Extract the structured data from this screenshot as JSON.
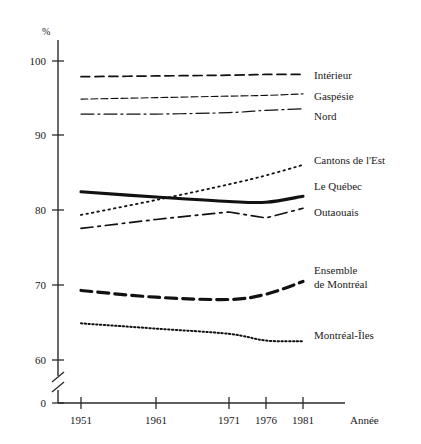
{
  "chart_data": {
    "type": "line",
    "title": "",
    "xlabel": "Année",
    "ylabel": "%",
    "x": [
      1951,
      1961,
      1971,
      1976,
      1981
    ],
    "xtick_labels": [
      "1951",
      "1961",
      "1971",
      "1976",
      "1981"
    ],
    "ytick_labels": [
      "0",
      "60",
      "70",
      "80",
      "90",
      "100"
    ],
    "ylim": [
      60,
      100
    ],
    "y_axis_broken": true,
    "y_axis_break_label": "0",
    "grid": false,
    "legend_position": "right",
    "series": [
      {
        "name": "Intérieur",
        "style": "dashed",
        "values": [
          97.9,
          98.0,
          98.1,
          98.2,
          98.2
        ]
      },
      {
        "name": "Gaspésie",
        "style": "fine-dashed",
        "values": [
          94.9,
          95.1,
          95.3,
          95.4,
          95.6
        ]
      },
      {
        "name": "Nord",
        "style": "dash-dot",
        "values": [
          92.9,
          92.9,
          93.1,
          93.4,
          93.6
        ]
      },
      {
        "name": "Cantons de l'Est",
        "style": "dotted",
        "values": [
          79.4,
          81.4,
          83.5,
          84.7,
          86.1
        ]
      },
      {
        "name": "Le Québec",
        "style": "thick-solid",
        "values": [
          82.5,
          81.8,
          81.2,
          81.1,
          81.9
        ]
      },
      {
        "name": "Outaouais",
        "style": "long-dash-dot",
        "values": [
          77.6,
          78.8,
          79.8,
          79.0,
          80.3
        ]
      },
      {
        "name": "Ensemble de Montréal",
        "style": "thick-dashed",
        "values": [
          69.3,
          68.4,
          68.1,
          68.8,
          70.5
        ]
      },
      {
        "name": "Montréal-Îles",
        "style": "fine-dotted",
        "values": [
          64.9,
          64.2,
          63.5,
          62.6,
          62.5
        ]
      }
    ]
  },
  "legend": {
    "entries": [
      {
        "label": "Intérieur"
      },
      {
        "label": "Gaspésie"
      },
      {
        "label": "Nord"
      },
      {
        "label": "Cantons de l'Est"
      },
      {
        "label": "Le Québec"
      },
      {
        "label": "Outaouais"
      },
      {
        "label": "Ensemble"
      },
      {
        "label": "de Montréal"
      },
      {
        "label": "Montréal-Îles"
      }
    ]
  },
  "axes": {
    "y_unit": "%",
    "x_title": "Année",
    "y_ticks": [
      {
        "label": "100"
      },
      {
        "label": "90"
      },
      {
        "label": "80"
      },
      {
        "label": "70"
      },
      {
        "label": "60"
      },
      {
        "label": "0"
      }
    ],
    "x_ticks": [
      {
        "label": "1951"
      },
      {
        "label": "1961"
      },
      {
        "label": "1971"
      },
      {
        "label": "1976"
      },
      {
        "label": "1981"
      }
    ]
  }
}
